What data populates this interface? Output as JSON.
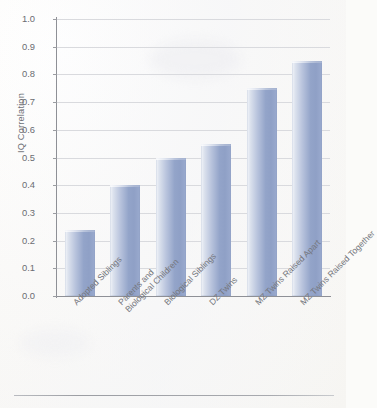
{
  "chart_data": {
    "type": "bar",
    "title": "",
    "subtitle": "",
    "xlabel": "",
    "ylabel": "IQ Correlation",
    "ylim": [
      0.0,
      1.0
    ],
    "grid": true,
    "legend": "none",
    "categories": [
      "Adopted Siblings",
      "Parents and Biological Children",
      "Biological Siblings",
      "DZ Twins",
      "MZ Twins Raised Apart",
      "MZ Twins Raised Together"
    ],
    "category_lines": [
      [
        "Adopted Siblings"
      ],
      [
        "Parents and",
        "Biological Children"
      ],
      [
        "Biological Siblings"
      ],
      [
        "DZ Twins"
      ],
      [
        "MZ Twins Raised Apart"
      ],
      [
        "MZ Twins Raised Together"
      ]
    ],
    "values": [
      0.24,
      0.4,
      0.5,
      0.55,
      0.75,
      0.85
    ],
    "ytick_labels": [
      "1.0",
      "0.9",
      "0.8",
      "0.7",
      "0.6",
      "0.5",
      "0.4",
      "0.3",
      "0.2",
      "0.1",
      "0.0"
    ],
    "ytick_values": [
      1.0,
      0.9,
      0.8,
      0.7,
      0.6,
      0.5,
      0.4,
      0.3,
      0.2,
      0.1,
      0.0
    ],
    "bar_color": "#9aaace",
    "bar_highlight_color": "#f4f6fa",
    "gridline_color": "#d9dade",
    "axis_color": "#8e9096",
    "text_color": "#6e7076",
    "background_color": "#fbfbf9"
  }
}
